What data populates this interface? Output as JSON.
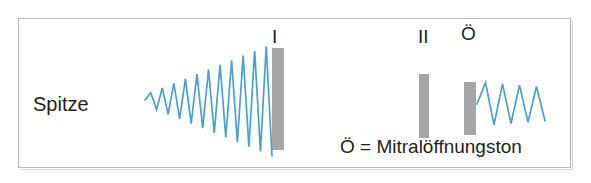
{
  "figure": {
    "title_text": "",
    "position_label": "Spitze",
    "legend": "Ö = Mitralöffnungston",
    "background_color": "#ffffff",
    "frame_color": "#b9b9b9",
    "wave_color": "#4a9fd4",
    "bar_color": "#a6a6a6",
    "text_color": "#231f20"
  },
  "sound_labels": [
    {
      "id": "s1",
      "text": "I"
    },
    {
      "id": "s2",
      "text": "II"
    },
    {
      "id": "oe",
      "text": "Ö"
    }
  ],
  "chart_data": {
    "type": "line",
    "xlabel": "",
    "ylabel": "",
    "grid": false,
    "legend_position": "bottom-right",
    "annotations": [
      {
        "label": "Spitze",
        "x": 33,
        "y": 104
      },
      {
        "label": "I",
        "x": 278,
        "y": 36
      },
      {
        "label": "II",
        "x": 424,
        "y": 36
      },
      {
        "label": "Ö",
        "x": 468,
        "y": 33
      },
      {
        "label": "Ö = Mitralöffnungston",
        "x": 340,
        "y": 146
      }
    ],
    "series": [
      {
        "name": "systolisches Crescendo-Geräusch",
        "type": "zigzag",
        "color": "#4a9fd4",
        "baseline_y": 100,
        "x_start": 145,
        "x_end": 272,
        "cycles": 11,
        "amplitude_start": 5,
        "amplitude_end": 56,
        "envelope": "crescendo"
      },
      {
        "name": "diastolisches Decrescendo-Geräusch",
        "type": "zigzag",
        "color": "#4a9fd4",
        "baseline_y": 104,
        "x_start": 477,
        "x_end": 545,
        "cycles": 4,
        "amplitude_start": 22,
        "amplitude_end": 17,
        "envelope": "decrescendo"
      }
    ],
    "bars": [
      {
        "name": "I",
        "x": 272,
        "y": 48,
        "width": 12,
        "height": 102,
        "color": "#a6a6a6"
      },
      {
        "name": "II",
        "x": 419,
        "y": 74,
        "width": 10,
        "height": 64,
        "color": "#a6a6a6"
      },
      {
        "name": "Ö",
        "x": 464,
        "y": 82,
        "width": 12,
        "height": 53,
        "color": "#a6a6a6"
      }
    ]
  }
}
